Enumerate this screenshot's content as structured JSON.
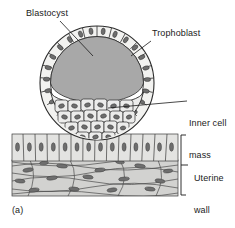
{
  "figure": {
    "panel_label": "(a)",
    "labels": {
      "blastocyst": "Blastocyst",
      "trophoblast": "Trophoblast",
      "inner_cell_mass_line1": "Inner cell",
      "inner_cell_mass_line2": "mass",
      "uterine_wall_line1": "Uterine",
      "uterine_wall_line2": "wall"
    },
    "colors": {
      "ink": "#1a1a1a",
      "outline": "#2b2b2b",
      "blastocoel_fill": "#a8a8a8",
      "cell_fill": "#e8e8e6",
      "nucleus_fill": "#6e6e6e",
      "stroma_fill": "#d2d2d0",
      "epithelium_fill": "#e3e3e1",
      "background": "#ffffff"
    },
    "structures": [
      {
        "name": "trophoblast",
        "description": "single outer ring of cuboidal cells with oval nuclei"
      },
      {
        "name": "blastocoel",
        "description": "large gray fluid-filled cavity"
      },
      {
        "name": "inner-cell-mass",
        "description": "dense cluster of polygonal cells at lower pole"
      },
      {
        "name": "uterine-epithelium",
        "description": "row of columnar cells with oval nuclei"
      },
      {
        "name": "uterine-stroma",
        "description": "wavy bands with elongated spindle nuclei"
      }
    ],
    "icons": {
      "leader_line": "leader-line",
      "bracket": "bracket"
    }
  }
}
